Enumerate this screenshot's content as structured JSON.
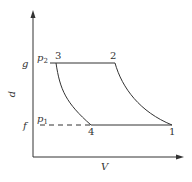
{
  "diagram": {
    "type": "p-V thermodynamic cycle",
    "axes": {
      "y_label": "p",
      "x_label": "V"
    },
    "levels": {
      "upper": {
        "tick_label": "g",
        "pressure_label": "p",
        "pressure_sub": "2"
      },
      "lower": {
        "tick_label": "f",
        "pressure_label": "p",
        "pressure_sub": "1"
      }
    },
    "points": [
      {
        "id": "1",
        "label": "1"
      },
      {
        "id": "2",
        "label": "2"
      },
      {
        "id": "3",
        "label": "3"
      },
      {
        "id": "4",
        "label": "4"
      }
    ],
    "processes": [
      {
        "from": "3",
        "to": "2",
        "kind": "isobaric (p2)"
      },
      {
        "from": "2",
        "to": "1",
        "kind": "expansion curve"
      },
      {
        "from": "1",
        "to": "4",
        "kind": "isobaric (p1)"
      },
      {
        "from": "4",
        "to": "3",
        "kind": "compression curve"
      }
    ],
    "colors": {
      "line": "#333333",
      "background": "#ffffff"
    }
  }
}
